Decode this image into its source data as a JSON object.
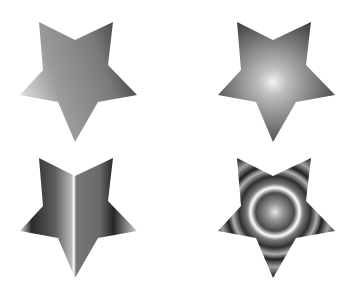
{
  "canvas": {
    "width": 357,
    "height": 293,
    "background": "#ffffff"
  },
  "star_shape": {
    "points": "39,22 75,40 113,22 108,65 137,95 98,102 75,142 58,102 20,95 43,70"
  },
  "stars": [
    {
      "id": "linear",
      "label": "Linear gradient star",
      "offset_x": 0,
      "offset_y": 0,
      "fill_type": "linear",
      "stops": [
        {
          "offset": "0%",
          "color": "#e6e6e6"
        },
        {
          "offset": "35%",
          "color": "#9a9a9a"
        },
        {
          "offset": "75%",
          "color": "#7a7a7a"
        },
        {
          "offset": "100%",
          "color": "#404040"
        }
      ]
    },
    {
      "id": "radial",
      "label": "Radial gradient star",
      "offset_x": 198,
      "offset_y": 0,
      "fill_type": "radial",
      "stops": [
        {
          "offset": "0%",
          "color": "#f2f2f2"
        },
        {
          "offset": "20%",
          "color": "#bdbdbd"
        },
        {
          "offset": "60%",
          "color": "#7d7d7d"
        },
        {
          "offset": "100%",
          "color": "#3c3c3c"
        }
      ]
    },
    {
      "id": "metallic",
      "label": "Metallic linear gradient star",
      "offset_x": 0,
      "offset_y": 136,
      "fill_type": "linear-bands",
      "stops": [
        {
          "offset": "0%",
          "color": "#d8d8d8"
        },
        {
          "offset": "10%",
          "color": "#2a2a2a"
        },
        {
          "offset": "30%",
          "color": "#5e5e5e"
        },
        {
          "offset": "44%",
          "color": "#b8b8b8"
        },
        {
          "offset": "46%",
          "color": "#ffffff"
        },
        {
          "offset": "48%",
          "color": "#777777"
        },
        {
          "offset": "68%",
          "color": "#6a6a6a"
        },
        {
          "offset": "80%",
          "color": "#262626"
        },
        {
          "offset": "100%",
          "color": "#d0d0d0"
        }
      ]
    },
    {
      "id": "rings",
      "label": "Repeating radial gradient star",
      "offset_x": 198,
      "offset_y": 136,
      "fill_type": "radial-rings",
      "stops": [
        {
          "offset": "0%",
          "color": "#e8e8e8"
        },
        {
          "offset": "12%",
          "color": "#9a9a9a"
        },
        {
          "offset": "30%",
          "color": "#4a4a4a"
        },
        {
          "offset": "38%",
          "color": "#ffffff"
        },
        {
          "offset": "44%",
          "color": "#7a7a7a"
        },
        {
          "offset": "56%",
          "color": "#2e2e2e"
        },
        {
          "offset": "66%",
          "color": "#b0b0b0"
        },
        {
          "offset": "74%",
          "color": "#1e1e1e"
        },
        {
          "offset": "86%",
          "color": "#a0a0a0"
        },
        {
          "offset": "100%",
          "color": "#2a2a2a"
        }
      ]
    }
  ]
}
